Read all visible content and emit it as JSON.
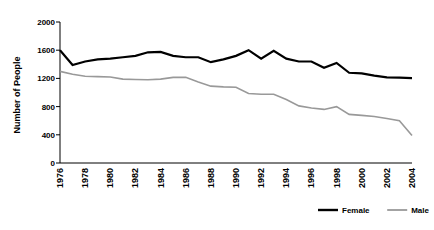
{
  "chart_data": {
    "type": "line",
    "title": "",
    "xlabel": "",
    "ylabel": "Number of People",
    "ylim": [
      0,
      2000
    ],
    "xlim": [
      1976,
      2004
    ],
    "yticks": [
      0,
      400,
      800,
      1200,
      1600,
      2000
    ],
    "ytick_labels": [
      "0",
      "400",
      "800",
      "1200",
      "1600",
      "2000"
    ],
    "xticks": [
      1976,
      1978,
      1980,
      1982,
      1984,
      1986,
      1988,
      1990,
      1992,
      1994,
      1996,
      1998,
      2000,
      2002,
      2004
    ],
    "xtick_labels": [
      "1976",
      "1978",
      "1980",
      "1982",
      "1984",
      "1986",
      "1988",
      "1990",
      "1992",
      "1994",
      "1996",
      "1998",
      "2000",
      "2002",
      "2004"
    ],
    "x": [
      1976,
      1977,
      1978,
      1979,
      1980,
      1981,
      1982,
      1983,
      1984,
      1985,
      1986,
      1987,
      1988,
      1989,
      1990,
      1991,
      1992,
      1993,
      1994,
      1995,
      1996,
      1997,
      1998,
      1999,
      2000,
      2001,
      2002,
      2003,
      2004
    ],
    "grid": false,
    "legend_position": "bottom-right",
    "series": [
      {
        "name": "Female",
        "color": "#000000",
        "values": [
          1600,
          1390,
          1440,
          1470,
          1480,
          1500,
          1520,
          1570,
          1575,
          1520,
          1500,
          1500,
          1430,
          1470,
          1520,
          1600,
          1480,
          1590,
          1480,
          1440,
          1440,
          1350,
          1420,
          1280,
          1270,
          1240,
          1215,
          1210,
          1205
        ]
      },
      {
        "name": "Male",
        "color": "#999999",
        "values": [
          1300,
          1260,
          1230,
          1225,
          1220,
          1190,
          1185,
          1180,
          1190,
          1215,
          1215,
          1150,
          1090,
          1080,
          1075,
          985,
          975,
          975,
          900,
          810,
          780,
          760,
          800,
          690,
          675,
          660,
          630,
          600,
          390
        ]
      }
    ]
  },
  "legend": {
    "items": [
      {
        "label": "Female",
        "color": "#000000"
      },
      {
        "label": "Male",
        "color": "#999999"
      }
    ]
  },
  "axes": {
    "y_axis_title": "Number of People"
  }
}
